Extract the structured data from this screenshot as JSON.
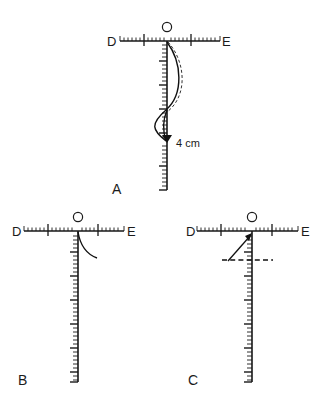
{
  "figure": {
    "title_absent": true,
    "background_color": "#ffffff",
    "ink_color": "#171717",
    "width": 332,
    "height": 402,
    "panels": [
      {
        "id": "A",
        "letter": "A",
        "letter_pos": {
          "x": 114,
          "y": 194
        },
        "origin_label": "O",
        "origin_label_pos": {
          "x": 166,
          "y": 27
        },
        "left_label": "D",
        "left_label_pos": {
          "x": 110,
          "y": 46
        },
        "right_label": "E",
        "right_label_pos": {
          "x": 224,
          "y": 46
        },
        "horizontal_ruler": {
          "x1": 120,
          "x2": 220,
          "y": 41,
          "major_ticks": [
            0.25,
            0.75
          ]
        },
        "vertical_ruler": {
          "x": 167,
          "y1": 41,
          "y2": 190,
          "major_ticks": [
            0.12,
            0.37,
            0.5,
            0.62,
            0.75,
            0.87
          ]
        },
        "annotation_label": "4 cm",
        "annotation_label_pos": {
          "x": 175,
          "y": 147
        },
        "deflection_curve_solid": true,
        "deflection_curve_dashed": true,
        "arrow_marker_y": 142
      },
      {
        "id": "B",
        "letter": "B",
        "letter_pos": {
          "x": 20,
          "y": 382
        },
        "origin_label": "O",
        "origin_label_pos": {
          "x": 73,
          "y": 220
        },
        "left_label": "D",
        "left_label_pos": {
          "x": 15,
          "y": 235
        },
        "right_label": "E",
        "right_label_pos": {
          "x": 128,
          "y": 235
        },
        "horizontal_ruler": {
          "x1": 24,
          "x2": 124,
          "y": 231,
          "major_ticks": [
            0.25,
            0.75
          ]
        },
        "vertical_ruler": {
          "x": 78,
          "y1": 231,
          "y2": 382,
          "major_ticks": [
            0.12,
            0.25,
            0.37,
            0.5,
            0.62,
            0.75,
            0.87
          ]
        },
        "small_curve": true
      },
      {
        "id": "C",
        "letter": "C",
        "letter_pos": {
          "x": 190,
          "y": 382
        },
        "origin_label": "O",
        "origin_label_pos": {
          "x": 249,
          "y": 220
        },
        "left_label": "D",
        "left_label_pos": {
          "x": 188,
          "y": 235
        },
        "right_label": "E",
        "right_label_pos": {
          "x": 302,
          "y": 235
        },
        "horizontal_ruler": {
          "x1": 197,
          "x2": 298,
          "y": 231,
          "major_ticks": [
            0.25,
            0.75
          ]
        },
        "vertical_ruler": {
          "x": 252,
          "y1": 231,
          "y2": 382,
          "major_ticks": [
            0.12,
            0.25,
            0.37,
            0.5,
            0.62,
            0.75,
            0.87
          ]
        },
        "angle_arrow": true,
        "horizontal_dashed_line": {
          "x1": 222,
          "x2": 272,
          "y": 259
        }
      }
    ]
  },
  "labels": {
    "D": "D",
    "E": "E",
    "O": "O",
    "A": "A",
    "B": "B",
    "C": "C",
    "four_cm": "4 cm"
  }
}
